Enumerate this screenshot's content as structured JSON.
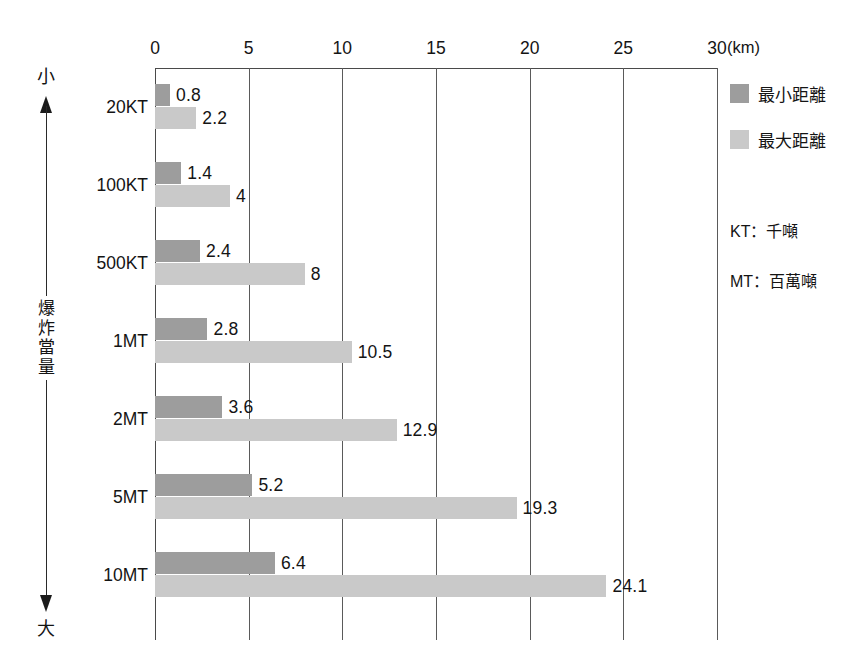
{
  "chart_data": {
    "type": "bar",
    "orientation": "horizontal",
    "title": "",
    "xlabel": "(km)",
    "ylabel": "爆炸當量",
    "xlim": [
      0,
      30
    ],
    "xticks": [
      0,
      5,
      10,
      15,
      20,
      25,
      30
    ],
    "xtick_labels": [
      "0",
      "5",
      "10",
      "15",
      "20",
      "25",
      "30"
    ],
    "x_unit": "(km)",
    "grid": true,
    "legend_position": "right",
    "categories": [
      "20KT",
      "100KT",
      "500KT",
      "1MT",
      "2MT",
      "5MT",
      "10MT"
    ],
    "series": [
      {
        "name": "最小距離",
        "color": "#9d9d9d",
        "values": [
          0.8,
          1.4,
          2.4,
          2.8,
          3.6,
          5.2,
          6.4
        ],
        "labels": [
          "0.8",
          "1.4",
          "2.4",
          "2.8",
          "3.6",
          "5.2",
          "6.4"
        ]
      },
      {
        "name": "最大距離",
        "color": "#c9c9c9",
        "values": [
          2.2,
          4,
          8,
          10.5,
          12.9,
          19.3,
          24.1
        ],
        "labels": [
          "2.2",
          "4",
          "8",
          "10.5",
          "12.9",
          "19.3",
          "24.1"
        ]
      }
    ],
    "axis_direction": {
      "top_label": "小",
      "bottom_label": "大"
    },
    "annotations": [
      "KT：千噸",
      "MT：百萬噸"
    ]
  },
  "legend": {
    "items": [
      {
        "label": "最小距離",
        "color": "#9d9d9d"
      },
      {
        "label": "最大距離",
        "color": "#c9c9c9"
      }
    ]
  },
  "notes": {
    "lines": [
      "KT：千噸",
      "MT：百萬噸"
    ]
  },
  "yaxis": {
    "title_chars": [
      "爆",
      "炸",
      "當",
      "量"
    ],
    "top_cap": "小",
    "bottom_cap": "大"
  }
}
